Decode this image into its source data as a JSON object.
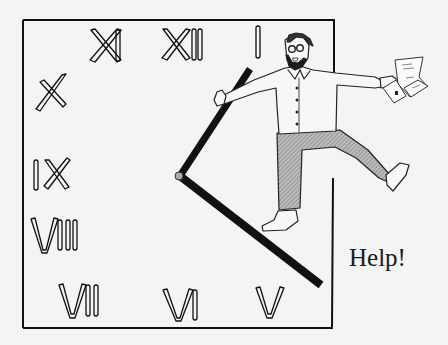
{
  "illustration": {
    "caption": "Help!",
    "clock_numerals": [
      {
        "label": "XI"
      },
      {
        "label": "XII"
      },
      {
        "label": "I"
      },
      {
        "label": "X"
      },
      {
        "label": "IX"
      },
      {
        "label": "VIII"
      },
      {
        "label": "VII"
      },
      {
        "label": "VI"
      },
      {
        "label": "V"
      }
    ],
    "elements": [
      "square-clock-face",
      "hour-hand",
      "minute-hand",
      "bearded-man",
      "papers"
    ],
    "colors": {
      "background": "#f4f4f2",
      "ink": "#111111",
      "trousers": "#9a9a9a"
    }
  }
}
